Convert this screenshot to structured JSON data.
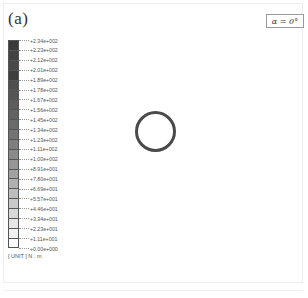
{
  "figure": {
    "panel_label": "(a)",
    "angle_label": "α = 0°",
    "unit_label": "[ UNIT ] N . m",
    "colorbar": {
      "labels": [
        "+2.34e+002",
        "+2.23e+002",
        "+2.12e+002",
        "+2.01e+002",
        "+1.89e+002",
        "+1.78e+002",
        "+1.67e+002",
        "+1.56e+002",
        "+1.45e+002",
        "+1.34e+002",
        "+1.23e+002",
        "+1.11e+002",
        "+1.00e+002",
        "+8.91e+001",
        "+7.80e+001",
        "+6.69e+001",
        "+5.57e+001",
        "+4.46e+001",
        "+3.34e+001",
        "+2.23e+001",
        "+1.11e+001",
        "+0.00e+000"
      ],
      "swatch_colors": [
        "#3a3a3a",
        "#424242",
        "#484848",
        "#3e3e3e",
        "#4e4e4e",
        "#545454",
        "#5c5c5c",
        "#626262",
        "#6a6a6a",
        "#747474",
        "#7e7e7e",
        "#8a8a8a",
        "#969696",
        "#a2a2a2",
        "#b0b0b0",
        "#bdbdbd",
        "#cacaca",
        "#d8d8d8",
        "#e6e6e6",
        "#f2f2f2",
        "#ffffff"
      ]
    },
    "shape": {
      "type": "circle",
      "stroke_color": "#4a4a4a"
    }
  }
}
